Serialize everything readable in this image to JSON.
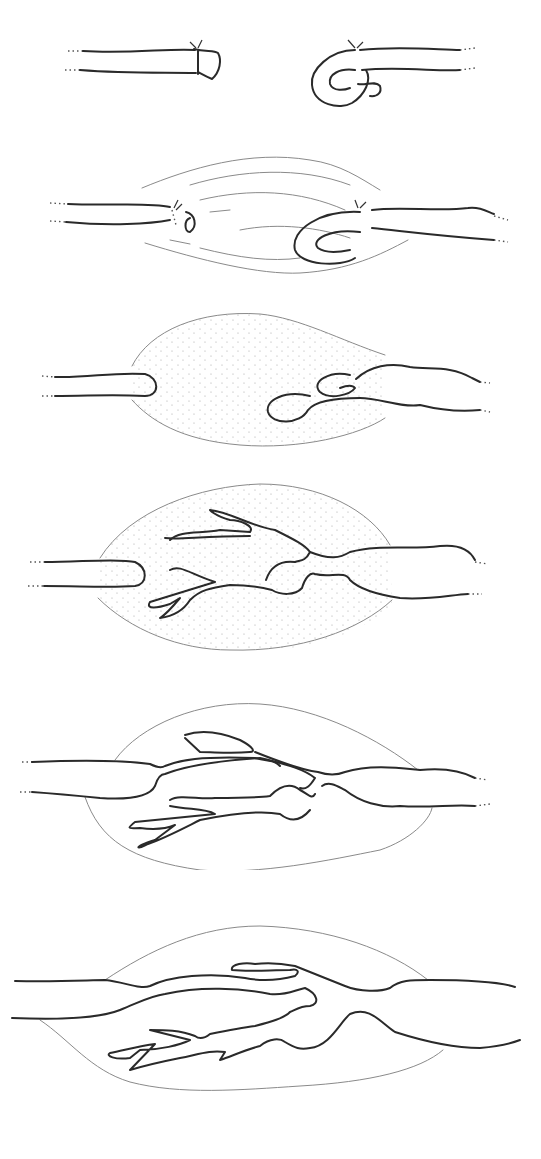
{
  "figure": {
    "panel_count": 6,
    "panels": [
      {
        "id": 1,
        "description": "Two ligated duct stumps separated, right stump looped back"
      },
      {
        "id": 2,
        "description": "Duct stumps within fibrous connective tissue strands"
      },
      {
        "id": 3,
        "description": "Stippled granulation tissue mass with bulbous right stump"
      },
      {
        "id": 4,
        "description": "Branching ductules sprouting from right stump into stippled mass"
      },
      {
        "id": 5,
        "description": "Ductules bridging gap, joining left stump"
      },
      {
        "id": 6,
        "description": "Reconnected continuous duct with residual branches"
      }
    ],
    "colors": {
      "line": "#2a2a2a",
      "tissue_outline": "#8a8a8a",
      "stipple": "#b0b0b0",
      "background": "#ffffff"
    }
  }
}
